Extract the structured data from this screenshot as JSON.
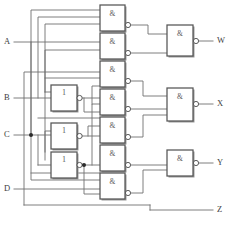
{
  "diagram": {
    "colors": {
      "wire": "#6f6f6f",
      "gate_border": "#555555",
      "gate_fill": "#ffffff",
      "label": "#3d3d3d",
      "background": "#ffffff"
    }
  },
  "inputs": [
    {
      "id": "A",
      "label": "A",
      "y": 42
    },
    {
      "id": "B",
      "label": "B",
      "y": 98
    },
    {
      "id": "C",
      "label": "C",
      "y": 135
    },
    {
      "id": "D",
      "label": "D",
      "y": 189
    }
  ],
  "outputs": [
    {
      "id": "W",
      "label": "W",
      "y": 41
    },
    {
      "id": "X",
      "label": "X",
      "y": 104
    },
    {
      "id": "Y",
      "label": "Y",
      "y": 163
    },
    {
      "id": "Z",
      "label": "Z",
      "y": 210
    }
  ],
  "inverters": [
    {
      "id": "inv1",
      "label": "1",
      "x": 51,
      "y": 85,
      "w": 26,
      "h": 26
    },
    {
      "id": "inv2",
      "label": "1",
      "x": 51,
      "y": 123,
      "w": 26,
      "h": 26
    },
    {
      "id": "inv3",
      "label": "1",
      "x": 51,
      "y": 152,
      "w": 26,
      "h": 26
    }
  ],
  "nand_gates": [
    {
      "id": "nand1",
      "label": "&",
      "x": 100,
      "y": 5,
      "w": 25,
      "h": 26,
      "inputs": 3
    },
    {
      "id": "nand2",
      "label": "&",
      "x": 100,
      "y": 33,
      "w": 25,
      "h": 26,
      "inputs": 3
    },
    {
      "id": "nand3",
      "label": "&",
      "x": 100,
      "y": 61,
      "w": 25,
      "h": 26,
      "inputs": 3
    },
    {
      "id": "nand4",
      "label": "&",
      "x": 100,
      "y": 89,
      "w": 25,
      "h": 26,
      "inputs": 3
    },
    {
      "id": "nand5",
      "label": "&",
      "x": 100,
      "y": 117,
      "w": 25,
      "h": 26,
      "inputs": 3
    },
    {
      "id": "nand6",
      "label": "&",
      "x": 100,
      "y": 145,
      "w": 25,
      "h": 26,
      "inputs": 3
    },
    {
      "id": "nand7",
      "label": "&",
      "x": 100,
      "y": 173,
      "w": 25,
      "h": 26,
      "inputs": 3
    }
  ],
  "output_gates": [
    {
      "id": "gateW",
      "label": "&",
      "x": 167,
      "y": 25,
      "w": 26,
      "h": 31,
      "inputs": 2,
      "output": "W"
    },
    {
      "id": "gateX",
      "label": "&",
      "x": 167,
      "y": 88,
      "w": 26,
      "h": 33,
      "inputs": 3,
      "output": "X"
    },
    {
      "id": "gateY",
      "label": "&",
      "x": 167,
      "y": 150,
      "w": 26,
      "h": 26,
      "inputs": 2,
      "output": "Y"
    }
  ],
  "junctions": [
    {
      "id": "junction-c",
      "x": 31,
      "y": 135
    },
    {
      "id": "junction-inv3-out",
      "x": 84,
      "y": 165
    }
  ],
  "symbols": {
    "and_gate": "&",
    "inverter": "1",
    "inversion_bubble": "o"
  }
}
